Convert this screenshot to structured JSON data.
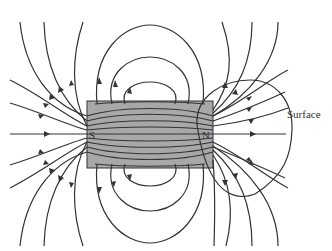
{
  "diagram": {
    "magnet": {
      "south_label": "S",
      "north_label": "N",
      "fill_color": "#a8a8a8",
      "border_color": "#333333"
    },
    "surface_label": "Surface",
    "line_color": "#333333"
  }
}
